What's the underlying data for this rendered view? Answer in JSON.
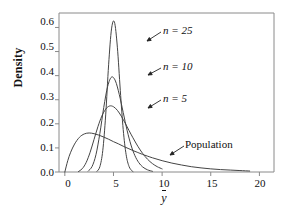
{
  "chart_data": {
    "type": "line",
    "title": "",
    "xlabel": "ȳ",
    "ylabel": "Density",
    "xlim": [
      -0.6,
      21.5
    ],
    "ylim": [
      0.0,
      0.66
    ],
    "grid": false,
    "legend_position": "inline-annotations",
    "xticks": [
      0,
      5,
      10,
      15,
      20
    ],
    "xtick_labels": [
      "0",
      "5",
      "10",
      "15",
      "20"
    ],
    "yticks": [
      0.0,
      0.1,
      0.2,
      0.3,
      0.4,
      0.5,
      0.6
    ],
    "ytick_labels": [
      "0.0",
      "0.1",
      "0.2",
      "0.3",
      "0.4",
      "0.5",
      "0.6"
    ],
    "series": [
      {
        "name": "Population",
        "label": "Population",
        "color": "#444444",
        "peak_x": 2.5,
        "peak_y": 0.162,
        "x": [
          0.0,
          0.3,
          0.6,
          1.0,
          1.5,
          2.0,
          2.5,
          3.0,
          3.5,
          4.0,
          4.5,
          5.0,
          5.5,
          6.0,
          6.5,
          7.0,
          7.5,
          8.0,
          9.0,
          10.0,
          11.0,
          12.0,
          13.0,
          14.0,
          15.0,
          16.0,
          17.0,
          18.0,
          19.0
        ],
        "y": [
          0.0,
          0.047,
          0.082,
          0.116,
          0.144,
          0.158,
          0.162,
          0.159,
          0.153,
          0.145,
          0.136,
          0.126,
          0.117,
          0.107,
          0.098,
          0.089,
          0.081,
          0.073,
          0.059,
          0.047,
          0.037,
          0.029,
          0.022,
          0.017,
          0.013,
          0.01,
          0.008,
          0.006,
          0.004
        ]
      },
      {
        "name": "n = 5",
        "label": "n = 5",
        "color": "#444444",
        "peak_x": 4.75,
        "peak_y": 0.275,
        "x": [
          1.4,
          1.8,
          2.2,
          2.6,
          3.0,
          3.4,
          3.8,
          4.2,
          4.6,
          5.0,
          5.4,
          5.8,
          6.2,
          6.6,
          7.0,
          7.5,
          8.0,
          8.5,
          9.0,
          9.5,
          10.0
        ],
        "y": [
          0.002,
          0.014,
          0.04,
          0.082,
          0.135,
          0.188,
          0.232,
          0.261,
          0.274,
          0.271,
          0.256,
          0.232,
          0.203,
          0.172,
          0.142,
          0.107,
          0.077,
          0.053,
          0.035,
          0.022,
          0.013
        ]
      },
      {
        "name": "n = 10",
        "label": "n = 10",
        "color": "#444444",
        "peak_x": 4.9,
        "peak_y": 0.395,
        "x": [
          2.4,
          2.8,
          3.2,
          3.6,
          4.0,
          4.4,
          4.8,
          5.2,
          5.6,
          6.0,
          6.4,
          6.8,
          7.2,
          7.6,
          8.0,
          8.5,
          9.0
        ],
        "y": [
          0.004,
          0.023,
          0.072,
          0.16,
          0.268,
          0.355,
          0.394,
          0.378,
          0.321,
          0.247,
          0.173,
          0.112,
          0.068,
          0.039,
          0.021,
          0.009,
          0.003
        ]
      },
      {
        "name": "n = 25",
        "label": "n = 25",
        "color": "#444444",
        "peak_x": 5.0,
        "peak_y": 0.625,
        "x": [
          3.3,
          3.6,
          3.9,
          4.2,
          4.5,
          4.8,
          5.1,
          5.4,
          5.7,
          6.0,
          6.3,
          6.6,
          6.9,
          7.0
        ],
        "y": [
          0.003,
          0.022,
          0.089,
          0.237,
          0.445,
          0.594,
          0.622,
          0.518,
          0.339,
          0.176,
          0.072,
          0.023,
          0.005,
          0.002
        ]
      }
    ],
    "annotations": [
      {
        "text": "n = 25",
        "kind": "series-label",
        "target_x": 5.6,
        "target_y": 0.52
      },
      {
        "text": "n = 10",
        "kind": "series-label",
        "target_x": 5.5,
        "target_y": 0.355
      },
      {
        "text": "n = 5",
        "kind": "series-label",
        "target_x": 5.5,
        "target_y": 0.25
      },
      {
        "text": "Population",
        "kind": "series-label",
        "target_x": 10.6,
        "target_y": 0.042
      }
    ]
  },
  "axis": {
    "y_title": "Density",
    "x_title": "y"
  }
}
